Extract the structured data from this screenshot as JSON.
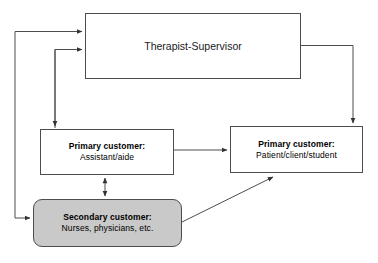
{
  "diagram": {
    "colors": {
      "line": "#4d4d4d",
      "node_fill": "#ffffff",
      "secondary_fill": "#c9c9c9",
      "text": "#000000"
    },
    "nodes": [
      {
        "id": "supervisor",
        "label": "Therapist-Supervisor",
        "shape": "rectangle",
        "fill": "#ffffff"
      },
      {
        "id": "assistant",
        "title": "Primary customer:",
        "subtitle": "Assistant/aide",
        "shape": "rectangle",
        "fill": "#ffffff"
      },
      {
        "id": "patient",
        "title": "Primary customer:",
        "subtitle": "Patient/client/student",
        "shape": "rectangle",
        "fill": "#ffffff"
      },
      {
        "id": "secondary",
        "title": "Secondary customer:",
        "subtitle": "Nurses, physicians, etc.",
        "shape": "rounded-rectangle",
        "fill": "#c9c9c9"
      }
    ],
    "connectors": [
      {
        "id": "secondary-to-supervisor",
        "from": "secondary",
        "to": "supervisor",
        "style": "orthogonal",
        "arrows": "end"
      },
      {
        "id": "assistant-to-supervisor",
        "from": "assistant",
        "to": "supervisor",
        "style": "orthogonal",
        "arrows": "end"
      },
      {
        "id": "supervisor-to-assistant",
        "from": "supervisor",
        "to": "assistant",
        "style": "orthogonal",
        "arrows": "end"
      },
      {
        "id": "supervisor-to-patient",
        "from": "supervisor",
        "to": "patient",
        "style": "orthogonal",
        "arrows": "end"
      },
      {
        "id": "supervisor-to-secondary",
        "from": "supervisor",
        "to": "secondary",
        "style": "orthogonal",
        "arrows": "end"
      },
      {
        "id": "assistant-to-patient",
        "from": "assistant",
        "to": "patient",
        "style": "straight",
        "arrows": "end"
      },
      {
        "id": "assistant-secondary-bidirectional",
        "from": "assistant",
        "to": "secondary",
        "style": "straight",
        "arrows": "both"
      },
      {
        "id": "secondary-to-patient",
        "from": "secondary",
        "to": "patient",
        "style": "diagonal",
        "arrows": "end"
      }
    ]
  }
}
